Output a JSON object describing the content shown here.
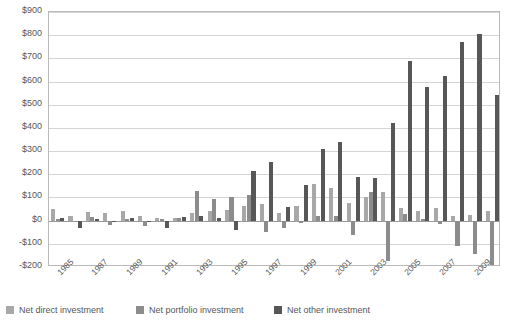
{
  "chart_data": {
    "type": "bar",
    "title": "",
    "subtitle": "",
    "xlabel": "",
    "ylabel": "",
    "ylim": [
      -200,
      900
    ],
    "ytick_step": 100,
    "ytick_labels": [
      "$900",
      "$800",
      "$700",
      "$600",
      "$500",
      "$400",
      "$300",
      "$200",
      "$100",
      "$0",
      "-$100",
      "-$200"
    ],
    "ytick_values": [
      900,
      800,
      700,
      600,
      500,
      400,
      300,
      200,
      100,
      0,
      -100,
      -200
    ],
    "grid": true,
    "legend_position": "bottom",
    "categories": [
      "1985",
      "1986",
      "1987",
      "1988",
      "1989",
      "1990",
      "1991",
      "1992",
      "1993",
      "1994",
      "1995",
      "1996",
      "1997",
      "1998",
      "1999",
      "2000",
      "2001",
      "2002",
      "2003",
      "2004",
      "2005",
      "2006",
      "2007",
      "2008",
      "2009",
      "2010"
    ],
    "xtick_labels": [
      "1985",
      "1987",
      "1989",
      "1991",
      "1993",
      "1995",
      "1997",
      "1999",
      "2001",
      "2003",
      "2005",
      "2007",
      "2009"
    ],
    "series": [
      {
        "name": "Net direct investment",
        "color": "#a8a8a8",
        "values": [
          50,
          20,
          38,
          35,
          40,
          20,
          10,
          12,
          35,
          40,
          48,
          62,
          70,
          35,
          65,
          160,
          140,
          75,
          100,
          125,
          55,
          40,
          55,
          20,
          25,
          40
        ]
      },
      {
        "name": "Net portfolio investment",
        "color": "#8c8c8c",
        "values": [
          5,
          -5,
          15,
          -20,
          8,
          -25,
          5,
          10,
          130,
          95,
          100,
          110,
          -48,
          -30,
          -12,
          18,
          20,
          -60,
          125,
          -175,
          30,
          5,
          -15,
          -110,
          -145,
          -195
        ]
      },
      {
        "name": "Net other investment",
        "color": "#575757",
        "values": [
          12,
          -30,
          6,
          -8,
          10,
          -5,
          -30,
          15,
          18,
          10,
          -40,
          215,
          255,
          60,
          155,
          310,
          340,
          190,
          185,
          420,
          690,
          575,
          625,
          770,
          805,
          540
        ]
      }
    ],
    "extra_series_note": "",
    "series_2010_extra": [
      -20,
      390,
      540
    ]
  },
  "legend": {
    "items": [
      {
        "label": "Net direct investment",
        "color": "#a8a8a8"
      },
      {
        "label": "Net portfolio investment",
        "color": "#8c8c8c"
      },
      {
        "label": "Net other investment",
        "color": "#575757"
      }
    ]
  },
  "colors": {
    "grid": "#d5d5d5",
    "axis": "#b9b9b9",
    "zero": "#9a9a9a",
    "text": "#575757",
    "background": "#ffffff"
  }
}
